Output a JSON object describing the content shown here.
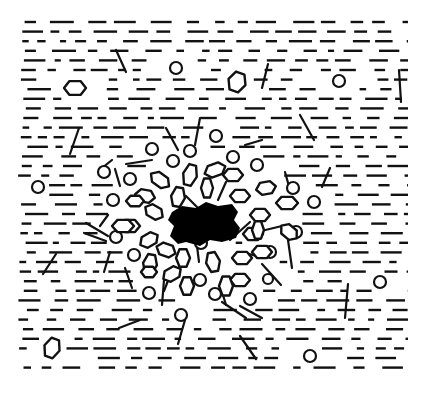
{
  "diagram": {
    "colors": {
      "background": "#ffffff",
      "ink": "#111111",
      "core": "#000000"
    },
    "field": {
      "x0": 18,
      "x1": 408,
      "y0": 22,
      "y1": 376,
      "row_spacing": 9.6
    },
    "center": {
      "x": 208,
      "y": 224
    },
    "core_blob": {
      "points": [
        [
          172,
          212
        ],
        [
          182,
          206
        ],
        [
          196,
          208
        ],
        [
          206,
          202
        ],
        [
          218,
          206
        ],
        [
          232,
          204
        ],
        [
          238,
          212
        ],
        [
          234,
          220
        ],
        [
          240,
          228
        ],
        [
          236,
          238
        ],
        [
          222,
          242
        ],
        [
          210,
          240
        ],
        [
          200,
          246
        ],
        [
          186,
          242
        ],
        [
          178,
          244
        ],
        [
          170,
          236
        ],
        [
          174,
          226
        ],
        [
          168,
          220
        ]
      ]
    },
    "hexagons": [
      {
        "x": 75,
        "y": 88,
        "rx": 11,
        "ry": 8,
        "rot": 0
      },
      {
        "x": 237,
        "y": 82,
        "rx": 9,
        "ry": 11,
        "rot": 20
      },
      {
        "x": 52,
        "y": 348,
        "rx": 8,
        "ry": 11,
        "rot": 20
      },
      {
        "x": 215,
        "y": 170,
        "rx": 11,
        "ry": 7,
        "rot": -20
      },
      {
        "x": 190,
        "y": 175,
        "rx": 7,
        "ry": 12,
        "rot": 15
      },
      {
        "x": 160,
        "y": 180,
        "rx": 11,
        "ry": 7,
        "rot": 35
      },
      {
        "x": 233,
        "y": 175,
        "rx": 10,
        "ry": 7,
        "rot": 0
      },
      {
        "x": 207,
        "y": 188,
        "rx": 6,
        "ry": 11,
        "rot": 0
      },
      {
        "x": 240,
        "y": 196,
        "rx": 10,
        "ry": 7,
        "rot": 0
      },
      {
        "x": 266,
        "y": 188,
        "rx": 10,
        "ry": 7,
        "rot": -10
      },
      {
        "x": 178,
        "y": 197,
        "rx": 7,
        "ry": 11,
        "rot": 10
      },
      {
        "x": 145,
        "y": 196,
        "rx": 10,
        "ry": 7,
        "rot": 10
      },
      {
        "x": 154,
        "y": 212,
        "rx": 10,
        "ry": 7,
        "rot": 30
      },
      {
        "x": 260,
        "y": 215,
        "rx": 10,
        "ry": 7,
        "rot": 0
      },
      {
        "x": 287,
        "y": 203,
        "rx": 11,
        "ry": 7,
        "rot": 0
      },
      {
        "x": 289,
        "y": 232,
        "rx": 10,
        "ry": 7,
        "rot": 40
      },
      {
        "x": 253,
        "y": 234,
        "rx": 10,
        "ry": 7,
        "rot": 0
      },
      {
        "x": 130,
        "y": 226,
        "rx": 10,
        "ry": 7,
        "rot": 0
      },
      {
        "x": 149,
        "y": 240,
        "rx": 10,
        "ry": 7,
        "rot": -30
      },
      {
        "x": 183,
        "y": 258,
        "rx": 7,
        "ry": 10,
        "rot": 0
      },
      {
        "x": 213,
        "y": 262,
        "rx": 7,
        "ry": 11,
        "rot": -10
      },
      {
        "x": 242,
        "y": 258,
        "rx": 10,
        "ry": 7,
        "rot": 0
      },
      {
        "x": 258,
        "y": 230,
        "rx": 6,
        "ry": 10,
        "rot": 0
      },
      {
        "x": 262,
        "y": 252,
        "rx": 10,
        "ry": 7,
        "rot": 0
      },
      {
        "x": 240,
        "y": 280,
        "rx": 10,
        "ry": 7,
        "rot": 0
      },
      {
        "x": 166,
        "y": 250,
        "rx": 10,
        "ry": 7,
        "rot": 20
      },
      {
        "x": 172,
        "y": 274,
        "rx": 10,
        "ry": 7,
        "rot": -30
      },
      {
        "x": 150,
        "y": 264,
        "rx": 7,
        "ry": 11,
        "rot": 10
      },
      {
        "x": 123,
        "y": 226,
        "rx": 11,
        "ry": 7,
        "rot": 0
      },
      {
        "x": 187,
        "y": 286,
        "rx": 7,
        "ry": 10,
        "rot": 0
      },
      {
        "x": 226,
        "y": 286,
        "rx": 7,
        "ry": 11,
        "rot": 0
      },
      {
        "x": 135,
        "y": 201,
        "rx": 9,
        "ry": 6,
        "rot": 0
      },
      {
        "x": 149,
        "y": 272,
        "rx": 8,
        "ry": 6,
        "rot": 0
      }
    ],
    "rings": [
      {
        "x": 176,
        "y": 68,
        "r": 6
      },
      {
        "x": 339,
        "y": 81,
        "r": 6
      },
      {
        "x": 216,
        "y": 136,
        "r": 6
      },
      {
        "x": 152,
        "y": 149,
        "r": 6
      },
      {
        "x": 190,
        "y": 151,
        "r": 6
      },
      {
        "x": 233,
        "y": 157,
        "r": 6
      },
      {
        "x": 173,
        "y": 161,
        "r": 6
      },
      {
        "x": 104,
        "y": 172,
        "r": 6
      },
      {
        "x": 130,
        "y": 179,
        "r": 6
      },
      {
        "x": 257,
        "y": 165,
        "r": 6
      },
      {
        "x": 38,
        "y": 187,
        "r": 6
      },
      {
        "x": 293,
        "y": 188,
        "r": 6
      },
      {
        "x": 113,
        "y": 200,
        "r": 6
      },
      {
        "x": 314,
        "y": 202,
        "r": 6
      },
      {
        "x": 116,
        "y": 237,
        "r": 6
      },
      {
        "x": 296,
        "y": 232,
        "r": 6
      },
      {
        "x": 270,
        "y": 252,
        "r": 6
      },
      {
        "x": 134,
        "y": 255,
        "r": 6
      },
      {
        "x": 200,
        "y": 280,
        "r": 6
      },
      {
        "x": 149,
        "y": 293,
        "r": 6
      },
      {
        "x": 215,
        "y": 294,
        "r": 6
      },
      {
        "x": 250,
        "y": 299,
        "r": 6
      },
      {
        "x": 181,
        "y": 315,
        "r": 6
      },
      {
        "x": 380,
        "y": 282,
        "r": 6
      },
      {
        "x": 310,
        "y": 356,
        "r": 6
      },
      {
        "x": 201,
        "y": 243,
        "r": 6
      },
      {
        "x": 268,
        "y": 279,
        "r": 5
      }
    ],
    "strokes": [
      [
        [
          116,
          50
        ],
        [
          126,
          72
        ]
      ],
      [
        [
          268,
          64
        ],
        [
          262,
          88
        ]
      ],
      [
        [
          399,
          70
        ],
        [
          401,
          102
        ]
      ],
      [
        [
          79,
          128
        ],
        [
          70,
          154
        ]
      ],
      [
        [
          166,
          128
        ],
        [
          178,
          150
        ]
      ],
      [
        [
          200,
          118
        ],
        [
          195,
          145
        ]
      ],
      [
        [
          300,
          115
        ],
        [
          314,
          140
        ]
      ],
      [
        [
          245,
          145
        ],
        [
          262,
          140
        ]
      ],
      [
        [
          126,
          164
        ],
        [
          152,
          160
        ]
      ],
      [
        [
          115,
          169
        ],
        [
          120,
          186
        ]
      ],
      [
        [
          330,
          168
        ],
        [
          322,
          187
        ]
      ],
      [
        [
          112,
          160
        ],
        [
          102,
          168
        ]
      ],
      [
        [
          285,
          172
        ],
        [
          290,
          190
        ]
      ],
      [
        [
          226,
          182
        ],
        [
          218,
          200
        ]
      ],
      [
        [
          186,
          196
        ],
        [
          198,
          208
        ]
      ],
      [
        [
          108,
          215
        ],
        [
          100,
          226
        ]
      ],
      [
        [
          86,
          223
        ],
        [
          108,
          236
        ]
      ],
      [
        [
          56,
          254
        ],
        [
          43,
          274
        ]
      ],
      [
        [
          84,
          233
        ],
        [
          106,
          241
        ]
      ],
      [
        [
          110,
          252
        ],
        [
          104,
          272
        ]
      ],
      [
        [
          125,
          268
        ],
        [
          132,
          288
        ]
      ],
      [
        [
          164,
          280
        ],
        [
          162,
          305
        ]
      ],
      [
        [
          257,
          232
        ],
        [
          282,
          226
        ]
      ],
      [
        [
          288,
          240
        ],
        [
          292,
          268
        ]
      ],
      [
        [
          262,
          264
        ],
        [
          281,
          285
        ]
      ],
      [
        [
          230,
          240
        ],
        [
          250,
          222
        ]
      ],
      [
        [
          246,
          253
        ],
        [
          263,
          258
        ]
      ],
      [
        [
          348,
          284
        ],
        [
          345,
          318
        ]
      ],
      [
        [
          240,
          306
        ],
        [
          262,
          318
        ]
      ],
      [
        [
          185,
          320
        ],
        [
          178,
          344
        ]
      ],
      [
        [
          119,
          328
        ],
        [
          140,
          320
        ]
      ],
      [
        [
          222,
          302
        ],
        [
          246,
          318
        ]
      ],
      [
        [
          240,
          336
        ],
        [
          256,
          359
        ]
      ],
      [
        [
          197,
          246
        ],
        [
          199,
          262
        ]
      ],
      [
        [
          171,
          273
        ],
        [
          164,
          291
        ]
      ],
      [
        [
          220,
          285
        ],
        [
          226,
          305
        ]
      ]
    ]
  }
}
